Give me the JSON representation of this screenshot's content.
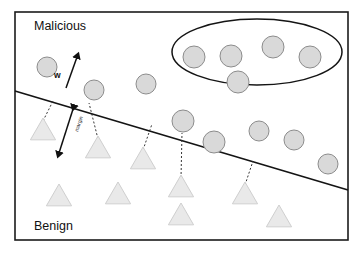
{
  "figure": {
    "width": 361,
    "height": 253,
    "background_color": "#ffffff"
  },
  "frame": {
    "x": 15,
    "y": 12,
    "width": 333,
    "height": 228,
    "stroke_color": "#1b1b1b"
  },
  "labels": {
    "top_class": "Malicious",
    "bottom_class": "Benign",
    "weight_vector": "w",
    "margin": "margin"
  },
  "label_positions": {
    "top_class": {
      "x": 34,
      "y": 30
    },
    "bottom_class": {
      "x": 34,
      "y": 230
    },
    "weight_vector": {
      "x": 54,
      "y": 78
    },
    "margin": {
      "x": 78,
      "y": 132
    }
  },
  "colors": {
    "malicious_fill": "#d9d9d9",
    "malicious_stroke": "#8c8c8c",
    "benign_fill": "#e9e9e9",
    "benign_stroke": "#cfcfcf",
    "boundary": "#141414",
    "connector": "#2b2b2b",
    "ellipse": "#141414",
    "frame": "#1b1b1b",
    "text": "#111111"
  },
  "decision_boundary": {
    "x1": 15,
    "y1": 91,
    "x2": 348,
    "y2": 190,
    "stroke_width": 1.7
  },
  "cluster_ellipse": {
    "cx": 257,
    "cy": 52,
    "rx": 85,
    "ry": 33,
    "stroke_width": 1.5
  },
  "weight_arrow": {
    "x1": 66,
    "y1": 88,
    "x2": 77,
    "y2": 57,
    "head_size": 5
  },
  "margin_arrow": {
    "x1": 74,
    "y1": 106,
    "x2": 59,
    "y2": 153,
    "head_size": 5,
    "text_rotation": -72
  },
  "malicious_points": [
    {
      "cx": 47,
      "cy": 67,
      "r": 10
    },
    {
      "cx": 94,
      "cy": 90,
      "r": 10
    },
    {
      "cx": 146,
      "cy": 84,
      "r": 10
    },
    {
      "cx": 194,
      "cy": 57,
      "r": 11
    },
    {
      "cx": 231,
      "cy": 56,
      "r": 11
    },
    {
      "cx": 273,
      "cy": 47,
      "r": 11
    },
    {
      "cx": 310,
      "cy": 57,
      "r": 11
    },
    {
      "cx": 238,
      "cy": 82,
      "r": 11
    },
    {
      "cx": 183,
      "cy": 121,
      "r": 11
    },
    {
      "cx": 214,
      "cy": 142,
      "r": 11
    },
    {
      "cx": 259,
      "cy": 131,
      "r": 10
    },
    {
      "cx": 294,
      "cy": 140,
      "r": 10
    },
    {
      "cx": 328,
      "cy": 164,
      "r": 10
    }
  ],
  "benign_points": [
    {
      "cx": 43,
      "cy": 130,
      "size": 12
    },
    {
      "cx": 98,
      "cy": 148,
      "size": 12
    },
    {
      "cx": 143,
      "cy": 159,
      "size": 12
    },
    {
      "cx": 59,
      "cy": 196,
      "size": 12
    },
    {
      "cx": 118,
      "cy": 194,
      "size": 12
    },
    {
      "cx": 181,
      "cy": 187,
      "size": 12
    },
    {
      "cx": 181,
      "cy": 215,
      "size": 12
    },
    {
      "cx": 245,
      "cy": 194,
      "size": 12
    },
    {
      "cx": 279,
      "cy": 217,
      "size": 12
    }
  ],
  "support_connectors": [
    {
      "x1": 43,
      "y1": 121,
      "x2": 53,
      "y2": 101
    },
    {
      "x1": 98,
      "y1": 139,
      "x2": 89,
      "y2": 103
    },
    {
      "x1": 143,
      "y1": 150,
      "x2": 152,
      "y2": 124
    },
    {
      "x1": 181,
      "y1": 178,
      "x2": 182,
      "y2": 133
    },
    {
      "x1": 245,
      "y1": 185,
      "x2": 253,
      "y2": 161
    }
  ],
  "counts": {
    "malicious_points": 13,
    "benign_points": 9,
    "clustered_points": 5,
    "support_connectors": 5
  }
}
